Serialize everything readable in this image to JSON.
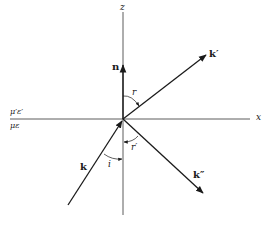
{
  "diagram": {
    "type": "reflection-refraction-geometry",
    "axes": {
      "z_label": "z",
      "x_label": "x"
    },
    "media": {
      "upper": "μ′ε′",
      "lower": "με"
    },
    "vectors": {
      "normal": "n",
      "incident": "k",
      "refracted": "k′",
      "reflected": "k″"
    },
    "angles": {
      "incidence": "i",
      "refraction": "r",
      "reflection": "r′"
    },
    "colors": {
      "ink": "#1a1a1a",
      "background": "#ffffff"
    }
  }
}
